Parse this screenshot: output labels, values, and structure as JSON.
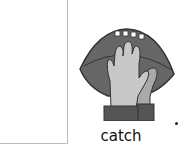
{
  "card": {
    "word": "catch",
    "picture": "football-catch-icon",
    "punctuation": "."
  },
  "colors": {
    "ball": "#666666",
    "hand_front": "#c8c8c8",
    "hand_back": "#a9a9a9",
    "sleeve": "#555555",
    "box_border": "#bdbdbd"
  }
}
